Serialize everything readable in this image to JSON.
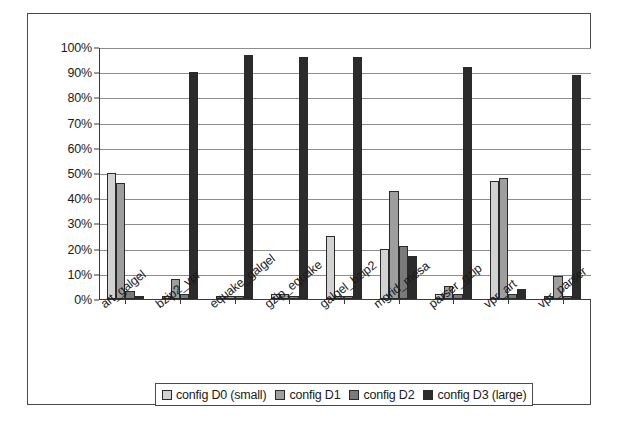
{
  "chart_data": {
    "type": "bar",
    "title": "",
    "subtitle": "",
    "xlabel": "",
    "ylabel": "",
    "ylim": [
      0,
      100
    ],
    "y_unit": "%",
    "grid": true,
    "legend_position": "bottom",
    "y_ticks": [
      "0%",
      "10%",
      "20%",
      "30%",
      "40%",
      "50%",
      "60%",
      "70%",
      "80%",
      "90%",
      "100%"
    ],
    "y_tick_values": [
      0,
      10,
      20,
      30,
      40,
      50,
      60,
      70,
      80,
      90,
      100
    ],
    "categories": [
      "art_galgel",
      "bzip2_vpr",
      "equake_galgel",
      "gzip_equake",
      "galgel_bzip2",
      "mgrid_mesa",
      "parser_gzip",
      "vpr_art",
      "vpr_parser"
    ],
    "series": [
      {
        "name": "config D0 (small)",
        "color": "#d2d2d2",
        "values": [
          50,
          1,
          1,
          2,
          25,
          20,
          2,
          47,
          1
        ]
      },
      {
        "name": "config D1",
        "color": "#9e9e9e",
        "values": [
          46,
          8,
          1,
          2,
          1,
          43,
          5,
          48,
          9
        ]
      },
      {
        "name": "config D2",
        "color": "#7a7a7a",
        "values": [
          3,
          2,
          1,
          1,
          1,
          21,
          2,
          2,
          1
        ]
      },
      {
        "name": "config D3 (large)",
        "color": "#2b2b2b",
        "values": [
          1,
          90,
          97,
          96,
          96,
          17,
          92,
          4,
          89
        ]
      }
    ],
    "extra_bars": [
      {
        "category": "mgrid_mesa",
        "series": "config D3 (large)",
        "note": "tall bar 74% left of group"
      }
    ]
  },
  "legend": {
    "items": [
      {
        "label": "config D0 (small)",
        "color": "#d2d2d2"
      },
      {
        "label": "config D1",
        "color": "#9e9e9e"
      },
      {
        "label": "config D2",
        "color": "#7a7a7a"
      },
      {
        "label": "config D3 (large)",
        "color": "#2b2b2b"
      }
    ]
  }
}
